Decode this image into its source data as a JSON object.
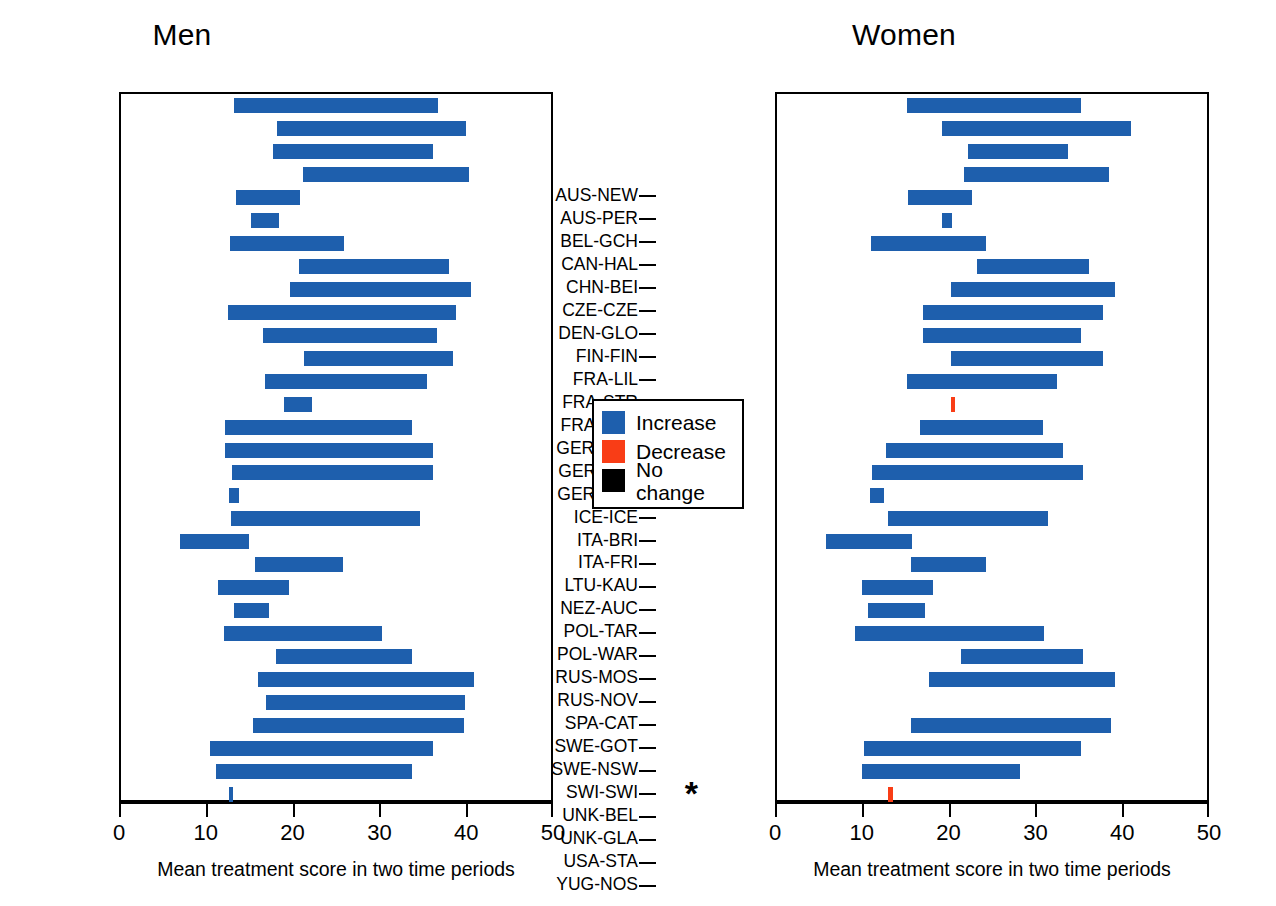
{
  "legend": {
    "items": [
      {
        "label": "Increase",
        "color": "#1e5fad",
        "key": "increase"
      },
      {
        "label": "Decrease",
        "color": "#f93d16",
        "key": "decrease"
      },
      {
        "label": "No change",
        "color": "#000000",
        "key": "nochange"
      }
    ]
  },
  "axis": {
    "xlabel": "Mean  treatment score in two time periods",
    "ticks": [
      0,
      10,
      20,
      30,
      40,
      50
    ],
    "xlim": [
      0,
      50
    ]
  },
  "chart_data": {
    "type": "bar",
    "subtype": "range-bar",
    "title": "",
    "xlabel": "Mean  treatment score in two time periods",
    "ylabel": "",
    "xlim": [
      0,
      50
    ],
    "xticks": [
      0,
      10,
      20,
      30,
      40,
      50
    ],
    "grid": false,
    "legend_position": "center-between-panels",
    "legend_entries": [
      "Increase",
      "Decrease",
      "No change"
    ],
    "colors": {
      "increase": "#1e5fad",
      "decrease": "#f93d16",
      "nochange": "#000000"
    },
    "categories": [
      "AUS-NEW",
      "AUS-PER",
      "BEL-GCH",
      "CAN-HAL",
      "CHN-BEI",
      "CZE-CZE",
      "DEN-GLO",
      "FIN-FIN",
      "FRA-LIL",
      "FRA-STR",
      "FRA-TOU",
      "GER-AUG",
      "GER-BRE",
      "GER-EGE",
      "ICE-ICE",
      "ITA-BRI",
      "ITA-FRI",
      "LTU-KAU",
      "NEZ-AUC",
      "POL-TAR",
      "POL-WAR",
      "RUS-MOS",
      "RUS-NOV",
      "SPA-CAT",
      "SWE-GOT",
      "SWE-NSW",
      "SWI-SWI",
      "UNK-BEL",
      "UNK-GLA",
      "USA-STA",
      "YUG-NOS"
    ],
    "panels": [
      {
        "name": "Men",
        "bars": [
          {
            "category": "AUS-NEW",
            "start": 13.0,
            "end": 36.5,
            "trend": "increase"
          },
          {
            "category": "AUS-PER",
            "start": 18.0,
            "end": 39.8,
            "trend": "increase"
          },
          {
            "category": "BEL-GCH",
            "start": 17.5,
            "end": 36.0,
            "trend": "increase"
          },
          {
            "category": "CAN-HAL",
            "start": 21.0,
            "end": 40.1,
            "trend": "increase"
          },
          {
            "category": "CHN-BEI",
            "start": 13.2,
            "end": 20.6,
            "trend": "increase"
          },
          {
            "category": "CZE-CZE",
            "start": 15.0,
            "end": 18.2,
            "trend": "increase"
          },
          {
            "category": "DEN-GLO",
            "start": 12.5,
            "end": 25.7,
            "trend": "increase"
          },
          {
            "category": "FIN-FIN",
            "start": 20.5,
            "end": 37.8,
            "trend": "increase"
          },
          {
            "category": "FRA-LIL",
            "start": 19.5,
            "end": 40.3,
            "trend": "increase"
          },
          {
            "category": "FRA-STR",
            "start": 12.3,
            "end": 38.6,
            "trend": "increase"
          },
          {
            "category": "FRA-TOU",
            "start": 16.4,
            "end": 36.4,
            "trend": "increase"
          },
          {
            "category": "GER-AUG",
            "start": 21.1,
            "end": 38.2,
            "trend": "increase"
          },
          {
            "category": "GER-BRE",
            "start": 16.6,
            "end": 35.2,
            "trend": "increase"
          },
          {
            "category": "GER-EGE",
            "start": 18.8,
            "end": 22.0,
            "trend": "increase"
          },
          {
            "category": "ICE-ICE",
            "start": 12.0,
            "end": 33.5,
            "trend": "increase"
          },
          {
            "category": "ITA-BRI",
            "start": 12.0,
            "end": 35.9,
            "trend": "increase"
          },
          {
            "category": "ITA-FRI",
            "start": 12.8,
            "end": 36.0,
            "trend": "increase"
          },
          {
            "category": "LTU-KAU",
            "start": 12.4,
            "end": 13.6,
            "trend": "increase"
          },
          {
            "category": "NEZ-AUC",
            "start": 12.7,
            "end": 34.4,
            "trend": "increase"
          },
          {
            "category": "POL-TAR",
            "start": 6.8,
            "end": 14.7,
            "trend": "increase"
          },
          {
            "category": "POL-WAR",
            "start": 15.4,
            "end": 25.6,
            "trend": "increase"
          },
          {
            "category": "RUS-MOS",
            "start": 11.2,
            "end": 19.4,
            "trend": "increase"
          },
          {
            "category": "RUS-NOV",
            "start": 13.0,
            "end": 17.0,
            "trend": "increase"
          },
          {
            "category": "SPA-CAT",
            "start": 11.9,
            "end": 30.1,
            "trend": "increase"
          },
          {
            "category": "SWE-GOT",
            "start": 17.9,
            "end": 33.5,
            "trend": "increase"
          },
          {
            "category": "SWE-NSW",
            "start": 15.8,
            "end": 40.7,
            "trend": "increase"
          },
          {
            "category": "SWI-SWI",
            "start": 16.7,
            "end": 39.6,
            "trend": "increase"
          },
          {
            "category": "UNK-BEL",
            "start": 15.2,
            "end": 39.5,
            "trend": "increase"
          },
          {
            "category": "UNK-GLA",
            "start": 10.2,
            "end": 36.0,
            "trend": "increase"
          },
          {
            "category": "USA-STA",
            "start": 11.0,
            "end": 33.5,
            "trend": "increase"
          },
          {
            "category": "YUG-NOS",
            "start": 12.4,
            "end": 12.9,
            "trend": "increase"
          }
        ],
        "notes": []
      },
      {
        "name": "Women",
        "bars": [
          {
            "category": "AUS-NEW",
            "start": 15.0,
            "end": 35.0,
            "trend": "increase"
          },
          {
            "category": "AUS-PER",
            "start": 19.0,
            "end": 40.8,
            "trend": "increase"
          },
          {
            "category": "BEL-GCH",
            "start": 22.0,
            "end": 33.5,
            "trend": "increase"
          },
          {
            "category": "CAN-HAL",
            "start": 21.5,
            "end": 38.3,
            "trend": "increase"
          },
          {
            "category": "CHN-BEI",
            "start": 15.1,
            "end": 22.5,
            "trend": "increase"
          },
          {
            "category": "CZE-CZE",
            "start": 19.0,
            "end": 20.2,
            "trend": "increase"
          },
          {
            "category": "DEN-GLO",
            "start": 10.8,
            "end": 24.1,
            "trend": "increase"
          },
          {
            "category": "FIN-FIN",
            "start": 23.0,
            "end": 36.0,
            "trend": "increase"
          },
          {
            "category": "FRA-LIL",
            "start": 20.0,
            "end": 38.9,
            "trend": "increase"
          },
          {
            "category": "FRA-STR",
            "start": 16.8,
            "end": 37.6,
            "trend": "increase"
          },
          {
            "category": "FRA-TOU",
            "start": 16.8,
            "end": 35.0,
            "trend": "increase"
          },
          {
            "category": "GER-AUG",
            "start": 20.0,
            "end": 37.6,
            "trend": "increase"
          },
          {
            "category": "GER-BRE",
            "start": 15.0,
            "end": 32.3,
            "trend": "increase"
          },
          {
            "category": "GER-EGE",
            "start": 20.0,
            "end": 20.4,
            "trend": "decrease"
          },
          {
            "category": "ICE-ICE",
            "start": 16.5,
            "end": 30.7,
            "trend": "increase"
          },
          {
            "category": "ITA-BRI",
            "start": 12.5,
            "end": 33.0,
            "trend": "increase"
          },
          {
            "category": "ITA-FRI",
            "start": 11.0,
            "end": 35.2,
            "trend": "increase"
          },
          {
            "category": "LTU-KAU",
            "start": 10.7,
            "end": 12.3,
            "trend": "increase"
          },
          {
            "category": "NEZ-AUC",
            "start": 12.8,
            "end": 31.2,
            "trend": "increase"
          },
          {
            "category": "POL-TAR",
            "start": 5.6,
            "end": 15.5,
            "trend": "increase"
          },
          {
            "category": "POL-WAR",
            "start": 15.4,
            "end": 24.1,
            "trend": "increase"
          },
          {
            "category": "RUS-MOS",
            "start": 9.8,
            "end": 18.0,
            "trend": "increase"
          },
          {
            "category": "RUS-NOV",
            "start": 10.5,
            "end": 17.0,
            "trend": "increase"
          },
          {
            "category": "SPA-CAT",
            "start": 9.0,
            "end": 30.8,
            "trend": "increase"
          },
          {
            "category": "SWE-GOT",
            "start": 21.2,
            "end": 35.3,
            "trend": "increase"
          },
          {
            "category": "SWE-NSW",
            "start": 17.5,
            "end": 38.9,
            "trend": "increase"
          },
          {
            "category": "UNK-BEL",
            "start": 15.4,
            "end": 38.5,
            "trend": "increase"
          },
          {
            "category": "UNK-GLA",
            "start": 10.0,
            "end": 35.0,
            "trend": "increase"
          },
          {
            "category": "USA-STA",
            "start": 9.8,
            "end": 28.0,
            "trend": "increase"
          },
          {
            "category": "YUG-NOS",
            "start": 12.8,
            "end": 13.3,
            "trend": "decrease"
          }
        ],
        "notes": [
          {
            "category": "SWI-SWI",
            "marker": "*"
          }
        ]
      }
    ]
  }
}
